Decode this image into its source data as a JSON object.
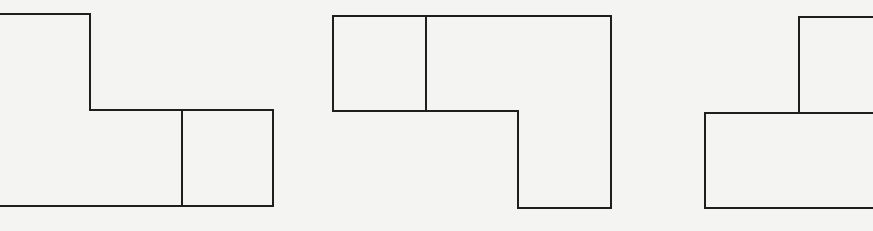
{
  "figure": {
    "shapes": [
      {
        "id": "shape-1",
        "label": "L-step shape with divided bottom-right",
        "cells": 3
      },
      {
        "id": "shape-2",
        "label": "Inverted L shape with divided top-left",
        "cells": 3
      },
      {
        "id": "shape-3",
        "label": "Stepped shape cut off at right edge",
        "cells": 2
      }
    ],
    "line_color": "#1e1e1e",
    "background_color": "#f4f4f2"
  }
}
